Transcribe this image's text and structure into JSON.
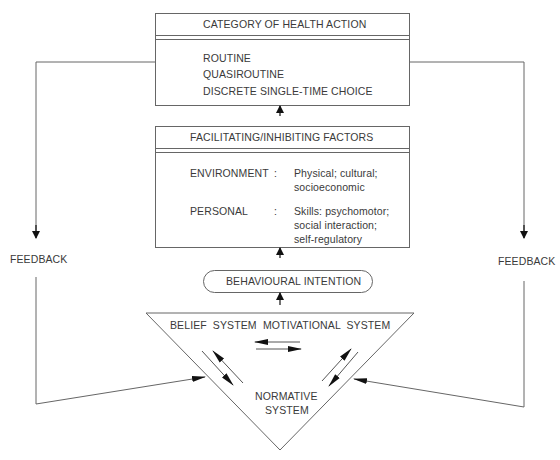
{
  "diagram": {
    "category_box": {
      "title": "CATEGORY OF HEALTH ACTION",
      "items": [
        "ROUTINE",
        "QUASIROUTINE",
        "DISCRETE SINGLE-TIME CHOICE"
      ]
    },
    "factors_box": {
      "title": "FACILITATING/INHIBITING FACTORS",
      "rows": [
        {
          "label": "ENVIRONMENT",
          "sep": ":",
          "lines": [
            "Physical; cultural;",
            "socioeconomic"
          ]
        },
        {
          "label": "PERSONAL",
          "sep": ":",
          "lines": [
            "Skills: psychomotor;",
            "social interaction;",
            "self-regulatory"
          ]
        }
      ]
    },
    "intention": {
      "label": "BEHAVIOURAL INTENTION"
    },
    "triangle": {
      "belief": "BELIEF  SYSTEM",
      "motivational": "MOTIVATIONAL  SYSTEM",
      "normative_line1": "NORMATIVE",
      "normative_line2": "SYSTEM"
    },
    "feedback_left": "FEEDBACK",
    "feedback_right": "FEEDBACK"
  },
  "colors": {
    "line": "#555555",
    "arrow": "#111111",
    "text": "#3a3a3a",
    "background": "#ffffff"
  }
}
